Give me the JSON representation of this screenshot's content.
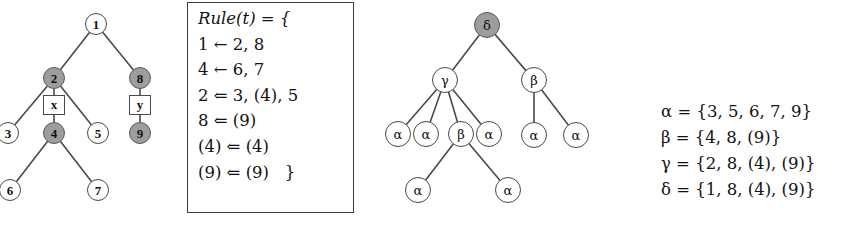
{
  "figure": {
    "caption": "",
    "background": "#ffffff",
    "line_color": "#4a4a4a",
    "shaded_node_color": "#9d9d9d",
    "node_fill": "#ffffff"
  },
  "tree_left": {
    "name": "numbered-tree",
    "nodes": [
      {
        "id": "n1",
        "label": "1",
        "x": 96,
        "y": 24,
        "shaded": false
      },
      {
        "id": "n2",
        "label": "2",
        "x": 54,
        "y": 78,
        "shaded": true
      },
      {
        "id": "n8",
        "label": "8",
        "x": 140,
        "y": 78,
        "shaded": true
      },
      {
        "id": "n3",
        "label": "3",
        "x": 8,
        "y": 133,
        "shaded": false
      },
      {
        "id": "n4",
        "label": "4",
        "x": 54,
        "y": 133,
        "shaded": true
      },
      {
        "id": "n5",
        "label": "5",
        "x": 98,
        "y": 133,
        "shaded": false
      },
      {
        "id": "n9",
        "label": "9",
        "x": 140,
        "y": 133,
        "shaded": true
      },
      {
        "id": "n6",
        "label": "6",
        "x": 10,
        "y": 190,
        "shaded": false
      },
      {
        "id": "n7",
        "label": "7",
        "x": 98,
        "y": 190,
        "shaded": false
      }
    ],
    "boxes": [
      {
        "id": "bx",
        "label": "x",
        "x": 54,
        "y": 105
      },
      {
        "id": "by",
        "label": "y",
        "x": 140,
        "y": 105
      }
    ],
    "edges": [
      [
        "n1",
        "n2"
      ],
      [
        "n1",
        "n8"
      ],
      [
        "n2",
        "n3"
      ],
      [
        "n2",
        "n5"
      ],
      [
        "n2",
        "bx"
      ],
      [
        "bx",
        "n4"
      ],
      [
        "n8",
        "by"
      ],
      [
        "by",
        "n9"
      ],
      [
        "n4",
        "n6"
      ],
      [
        "n4",
        "n7"
      ]
    ]
  },
  "rule_box": {
    "name": "rule-definition-box",
    "lines": [
      "Rule(t) = {",
      "1 ← 2, 8",
      "4 ← 6, 7",
      "2 ⇐ 3, (4), 5",
      "8 ⇐ (9)",
      "(4) ⇐ (4)",
      "(9) ⇐ (9)   }"
    ]
  },
  "tree_right": {
    "name": "greek-tree",
    "nodes": [
      {
        "id": "g-d",
        "label": "δ",
        "x": 487,
        "y": 25,
        "shaded": true
      },
      {
        "id": "g-g",
        "label": "γ",
        "x": 445,
        "y": 80,
        "shaded": false
      },
      {
        "id": "g-b1",
        "label": "β",
        "x": 534,
        "y": 80,
        "shaded": false
      },
      {
        "id": "g-a1",
        "label": "α",
        "x": 398,
        "y": 134,
        "shaded": false
      },
      {
        "id": "g-a2",
        "label": "α",
        "x": 426,
        "y": 134,
        "shaded": false
      },
      {
        "id": "g-b2",
        "label": "β",
        "x": 461,
        "y": 134,
        "shaded": false
      },
      {
        "id": "g-a3",
        "label": "α",
        "x": 489,
        "y": 134,
        "shaded": false
      },
      {
        "id": "g-a4",
        "label": "α",
        "x": 534,
        "y": 135,
        "shaded": false
      },
      {
        "id": "g-a5",
        "label": "α",
        "x": 576,
        "y": 135,
        "shaded": false
      },
      {
        "id": "g-a6",
        "label": "α",
        "x": 418,
        "y": 190,
        "shaded": false
      },
      {
        "id": "g-a7",
        "label": "α",
        "x": 508,
        "y": 190,
        "shaded": false
      }
    ],
    "edges": [
      [
        "g-d",
        "g-g"
      ],
      [
        "g-d",
        "g-b1"
      ],
      [
        "g-g",
        "g-a1"
      ],
      [
        "g-g",
        "g-a2"
      ],
      [
        "g-g",
        "g-b2"
      ],
      [
        "g-g",
        "g-a3"
      ],
      [
        "g-b1",
        "g-a4"
      ],
      [
        "g-b1",
        "g-a5"
      ],
      [
        "g-b2",
        "g-a6"
      ],
      [
        "g-b2",
        "g-a7"
      ]
    ]
  },
  "legend": {
    "name": "greek-set-definitions",
    "lines": [
      "α = {3, 5, 6, 7, 9}",
      "β = {4, 8, (9)}",
      "γ = {2, 8, (4), (9)}",
      "δ = {1, 8, (4), (9)}"
    ]
  }
}
